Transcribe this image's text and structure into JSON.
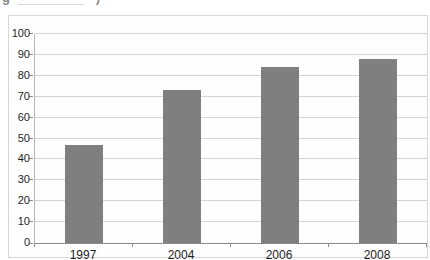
{
  "page": {
    "caption_fragment_left": "g",
    "caption_fragment_right": ")"
  },
  "chart_data": {
    "type": "bar",
    "title": "",
    "categories": [
      "1997",
      "2004",
      "2006",
      "2008"
    ],
    "values": [
      47,
      73,
      84,
      88
    ],
    "xlabel": "",
    "ylabel": "",
    "ylim": [
      0,
      100
    ],
    "y_ticks": [
      0,
      10,
      20,
      30,
      40,
      50,
      60,
      70,
      80,
      90,
      100
    ],
    "grid": true,
    "legend": "none",
    "colors": {
      "bar": "#7f7f7f",
      "gridline": "#d4d4d4",
      "x_axis_line": "#8c8c8c",
      "y_axis_line": "#b5b5b5",
      "tick": "#8c8c8c",
      "label_text": "#1f1f1f",
      "chart_border": "#d7d7d7",
      "plot_background": "#fefefe"
    }
  }
}
